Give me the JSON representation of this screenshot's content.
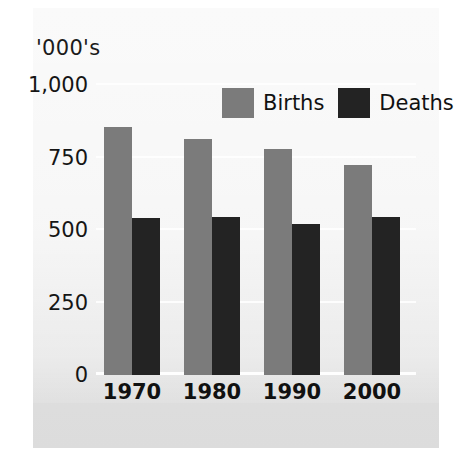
{
  "chart_data": {
    "type": "bar",
    "title": "",
    "subtitle": "",
    "xlabel": "",
    "ylabel": "'000's",
    "categories": [
      "1970",
      "1980",
      "1990",
      "2000"
    ],
    "series": [
      {
        "name": "Births",
        "color": "#7b7b7b",
        "values": [
          855,
          815,
          780,
          725
        ]
      },
      {
        "name": "Deaths",
        "color": "#232323",
        "values": [
          540,
          545,
          520,
          545
        ]
      }
    ],
    "ylim": [
      0,
      1000
    ],
    "yticks": [
      0,
      250,
      500,
      750,
      1000
    ],
    "ytick_labels": [
      "0",
      "250",
      "500",
      "750",
      "1,000"
    ],
    "grid": true,
    "grid_axis": "y",
    "legend_position": "top-center",
    "background_color": "#e3e3e3",
    "annotations": []
  }
}
